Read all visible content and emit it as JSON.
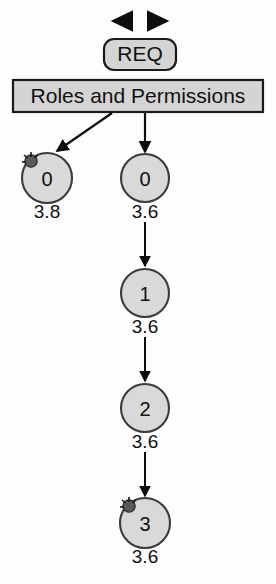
{
  "diagram": {
    "title_node": {
      "label": "REQ",
      "shape": "rounded-rect",
      "fill": "#d4d4d4",
      "stroke": "#1a1a1a"
    },
    "header_box": {
      "label": "Roles and Permissions",
      "shape": "rect",
      "fill": "#d4d4d4",
      "stroke": "#1a1a1a"
    },
    "top_arrows": {
      "left_arrow": "arrow-left",
      "right_arrow": "arrow-right"
    },
    "nodes": [
      {
        "id": "node-left-0",
        "value": "0",
        "score": "3.8",
        "marked": true,
        "marker": "star-burst"
      },
      {
        "id": "node-chain-0",
        "value": "0",
        "score": "3.6",
        "marked": false,
        "marker": ""
      },
      {
        "id": "node-chain-1",
        "value": "1",
        "score": "3.6",
        "marked": false,
        "marker": ""
      },
      {
        "id": "node-chain-2",
        "value": "2",
        "score": "3.6",
        "marked": false,
        "marker": ""
      },
      {
        "id": "node-chain-3",
        "value": "3",
        "score": "3.6",
        "marked": true,
        "marker": "star-burst"
      }
    ],
    "colors": {
      "node_fill": "#d9d9d9",
      "node_stroke": "#3b3b3b",
      "edge": "#0d0d0d",
      "text": "#111111",
      "background": "#fdfdfd"
    },
    "edges": [
      {
        "from": "header-box",
        "to": "node-left-0",
        "type": "diagonal-arrow"
      },
      {
        "from": "header-box",
        "to": "node-chain-0",
        "type": "vertical-arrow"
      },
      {
        "from": "node-chain-0",
        "to": "node-chain-1",
        "type": "vertical-arrow"
      },
      {
        "from": "node-chain-1",
        "to": "node-chain-2",
        "type": "vertical-arrow"
      },
      {
        "from": "node-chain-2",
        "to": "node-chain-3",
        "type": "vertical-arrow"
      }
    ]
  }
}
